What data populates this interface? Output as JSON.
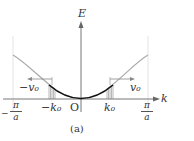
{
  "figure": {
    "caption": "(a)",
    "axes": {
      "x_label": "k",
      "y_label": "E",
      "origin_label": "O"
    },
    "ticks": {
      "left_bound": {
        "sign": "−",
        "numerator": "π",
        "denominator": "a"
      },
      "right_bound": {
        "numerator": "π",
        "denominator": "a"
      },
      "neg_k0": "−k₀",
      "pos_k0": "k₀"
    },
    "velocity_labels": {
      "neg": "−v₀",
      "pos": "v₀"
    },
    "colors": {
      "curve_outer": "#aaaaaa",
      "curve_inner": "#111111",
      "axis": "#777777",
      "hatch": "#888888"
    }
  }
}
